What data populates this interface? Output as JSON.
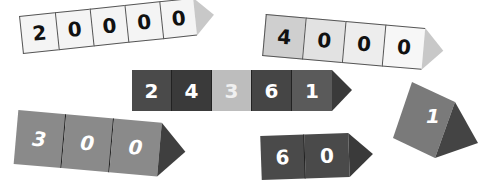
{
  "strips": [
    {
      "name": "strip-20000",
      "digits": [
        "2",
        "0",
        "0",
        "0",
        "0"
      ],
      "fills": [
        "#f4f4f4",
        "#f4f4f4",
        "#f4f4f4",
        "#f4f4f4",
        "#f4f4f4"
      ],
      "text_color": "#111111",
      "tip_color": "#c8c8c8"
    },
    {
      "name": "strip-4000",
      "digits": [
        "4",
        "0",
        "0",
        "0"
      ],
      "fills": [
        "#cfcfcf",
        "#e2e2e2",
        "#ededed",
        "#f7f7f7"
      ],
      "text_color": "#111111",
      "tip_color": "#c8c8c8"
    },
    {
      "name": "strip-24361",
      "digits": [
        "2",
        "4",
        "3",
        "6",
        "1"
      ],
      "fills": [
        "#4a4a4a",
        "#3a3a3a",
        "#bdbdbd",
        "#454545",
        "#5a5a5a"
      ],
      "text_color": "#ffffff",
      "tip_color": "#3a3a3a"
    },
    {
      "name": "strip-300",
      "digits": [
        "3",
        "0",
        "0"
      ],
      "fills": [
        "#8a8a8a",
        "#8a8a8a",
        "#8a8a8a"
      ],
      "text_color": "#ffffff",
      "tip_color": "#3f3f3f"
    },
    {
      "name": "strip-60",
      "digits": [
        "6",
        "0"
      ],
      "fills": [
        "#4a4a4a",
        "#4a4a4a"
      ],
      "text_color": "#ffffff",
      "tip_color": "#3a3a3a"
    }
  ],
  "single_prism": {
    "digit": "1",
    "face_color": "#7a7a7a",
    "side_color": "#444444",
    "text_color": "#ffffff"
  }
}
